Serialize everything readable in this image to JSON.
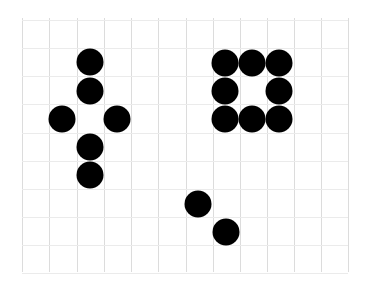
{
  "diagram": {
    "type": "dot-grid",
    "background": "#ffffff",
    "grid": {
      "line_color": "#dcdcdc",
      "vertical_x": [
        22,
        49,
        77,
        104,
        131,
        158,
        186,
        213,
        240,
        267,
        294,
        321,
        348
      ],
      "horizontal_y": [
        20,
        48,
        76,
        104,
        133,
        161,
        189,
        217,
        245,
        273
      ],
      "top": 18,
      "bottom": 272,
      "left": 22,
      "right": 348
    },
    "dot_color": "#000000",
    "dot_diameter": 27,
    "groups": [
      {
        "name": "cross-shape",
        "dots": [
          [
            90,
            62
          ],
          [
            90,
            91
          ],
          [
            62,
            119
          ],
          [
            117,
            119
          ],
          [
            90,
            147
          ],
          [
            90,
            175
          ]
        ]
      },
      {
        "name": "square-ring",
        "dots": [
          [
            225,
            63
          ],
          [
            252,
            63
          ],
          [
            279,
            63
          ],
          [
            225,
            91
          ],
          [
            279,
            91
          ],
          [
            225,
            119
          ],
          [
            252,
            119
          ],
          [
            279,
            119
          ]
        ]
      },
      {
        "name": "diagonal-pair",
        "dots": [
          [
            198,
            204
          ],
          [
            226,
            232
          ]
        ]
      }
    ]
  }
}
